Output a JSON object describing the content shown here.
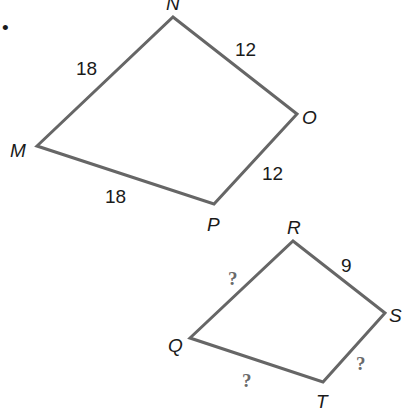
{
  "figure": {
    "stroke_color": "#666666",
    "quad1": {
      "vertices": {
        "M": "M",
        "N": "N",
        "O": "O",
        "P": "P"
      },
      "sides": {
        "MN": "18",
        "NO": "12",
        "OP": "12",
        "PM": "18"
      }
    },
    "quad2": {
      "vertices": {
        "Q": "Q",
        "R": "R",
        "S": "S",
        "T": "T"
      },
      "sides": {
        "QR": "?",
        "RS": "9",
        "ST": "?",
        "TQ": "?"
      }
    },
    "bullet": "•"
  }
}
